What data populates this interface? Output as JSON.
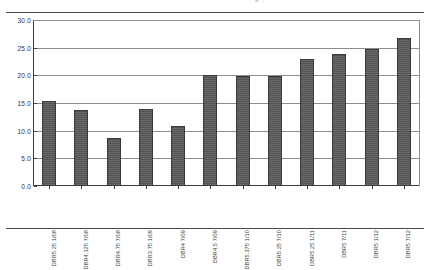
{
  "document": {
    "clipped_header_fragment": "g    ,"
  },
  "chart_data": {
    "type": "bar",
    "title": "",
    "subtitle": "",
    "xlabel": "",
    "ylabel": "",
    "ylim": [
      0.0,
      30.0
    ],
    "ytick_values": [
      0.0,
      5.0,
      10.0,
      15.0,
      20.0,
      25.0,
      30.0
    ],
    "ytick_labels": [
      "0.0",
      "5.0",
      "10.0",
      "15.0",
      "20.0",
      "25.0",
      "30.0"
    ],
    "grid": "horizontal",
    "legend": "none",
    "bar_color": "#585858",
    "categories": [
      "DBR5.25 1/08",
      "DBR4.125 7/08",
      "DBR4.75 7/08",
      "DBR3.75 1/09",
      "DBR4 7/09",
      "DBR4.5 7/09",
      "DBR5.375 1/10",
      "DBR5.25 7/10",
      "DBR5.25 1/11",
      "DBR5 7/11",
      "DBR5 1/12",
      "DBR5 7/12"
    ],
    "values": [
      15.3,
      13.8,
      8.7,
      14.0,
      10.9,
      20.0,
      19.9,
      19.8,
      22.9,
      23.9,
      24.8,
      26.8
    ]
  }
}
